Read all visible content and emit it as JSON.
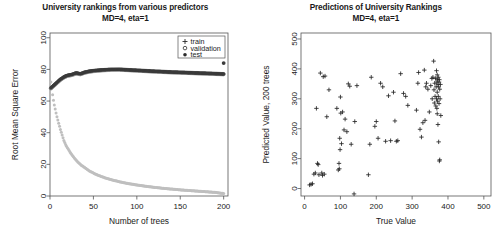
{
  "figure": {
    "background": "#ffffff",
    "panels": 2
  },
  "chart_data": [
    {
      "type": "line",
      "title": "University rankings from various predictors",
      "subtitle": "MD=4, eta=1",
      "xlabel": "Number of trees",
      "ylabel": "Root Mean Square Error",
      "xlim": [
        0,
        205
      ],
      "ylim": [
        0,
        103
      ],
      "xticks": [
        0,
        50,
        100,
        150,
        200
      ],
      "yticks": [
        0,
        20,
        40,
        60,
        80,
        100
      ],
      "grid": false,
      "legend_position": "top-right",
      "legend": [
        {
          "label": "train",
          "marker": "plus",
          "color": "#bcbcbc"
        },
        {
          "label": "validation",
          "marker": "circle-open",
          "color": "#8a8a8a"
        },
        {
          "label": "test",
          "marker": "circle-filled",
          "color": "#3a3a3a"
        }
      ],
      "series": [
        {
          "name": "train",
          "marker": "plus",
          "color": "#bfbfbf",
          "x": [
            1,
            2,
            3,
            4,
            5,
            6,
            7,
            8,
            9,
            10,
            12,
            14,
            16,
            18,
            20,
            24,
            28,
            32,
            36,
            40,
            45,
            50,
            55,
            60,
            65,
            70,
            80,
            90,
            100,
            110,
            120,
            130,
            140,
            150,
            160,
            170,
            180,
            190,
            200
          ],
          "values": [
            72.0,
            68.5,
            64.0,
            60.5,
            57.5,
            55.0,
            52.5,
            50.0,
            48.0,
            46.0,
            42.0,
            38.5,
            35.0,
            32.5,
            30.5,
            27.0,
            24.0,
            21.5,
            19.5,
            18.0,
            16.0,
            14.5,
            13.2,
            12.2,
            11.2,
            10.4,
            9.0,
            7.9,
            7.0,
            6.2,
            5.5,
            4.9,
            4.4,
            3.9,
            3.5,
            3.1,
            2.7,
            2.3,
            1.6
          ]
        },
        {
          "name": "validation",
          "marker": "circle-open",
          "color": "#8a8a8a",
          "x": [
            1,
            2,
            3,
            4,
            5,
            6,
            7,
            8,
            9,
            10,
            12,
            14,
            16,
            18,
            20,
            25,
            30,
            35,
            40,
            45,
            50,
            60,
            70,
            80,
            90,
            100,
            120,
            140,
            160,
            180,
            200
          ],
          "values": [
            68.0,
            68.5,
            69.0,
            69.5,
            70.0,
            70.5,
            71.0,
            71.5,
            72.0,
            72.5,
            73.5,
            74.2,
            75.0,
            75.5,
            76.0,
            76.5,
            77.5,
            77.0,
            78.0,
            78.6,
            79.0,
            79.5,
            79.8,
            79.9,
            79.6,
            79.3,
            78.7,
            78.2,
            77.8,
            77.4,
            77.0
          ]
        },
        {
          "name": "test",
          "marker": "circle-filled",
          "color": "#3a3a3a",
          "x": [
            1,
            2,
            3,
            4,
            5,
            6,
            7,
            8,
            9,
            10,
            12,
            14,
            16,
            18,
            20,
            25,
            30,
            35,
            40,
            45,
            50,
            60,
            70,
            80,
            90,
            100,
            120,
            140,
            160,
            180,
            200
          ],
          "values": [
            68.2,
            68.8,
            69.3,
            69.8,
            70.3,
            70.8,
            71.3,
            71.8,
            72.3,
            72.8,
            73.8,
            74.5,
            75.2,
            75.8,
            76.2,
            76.8,
            77.8,
            77.2,
            78.2,
            78.8,
            79.2,
            79.7,
            80.0,
            80.0,
            79.7,
            79.4,
            78.8,
            78.3,
            77.9,
            77.5,
            77.1
          ]
        }
      ]
    },
    {
      "type": "scatter",
      "title": "Predictions of University Rankings",
      "subtitle": "MD=4, eta=1",
      "xlabel": "True Value",
      "ylabel": "Predicted Value, 200 trees",
      "xlim": [
        -10,
        520
      ],
      "ylim": [
        -25,
        520
      ],
      "xticks": [
        0,
        100,
        200,
        300,
        400,
        500
      ],
      "yticks": [
        0,
        100,
        200,
        300,
        400,
        500
      ],
      "grid": false,
      "marker": "plus",
      "marker_color": "#262626",
      "points": [
        [
          14,
          12
        ],
        [
          18,
          14
        ],
        [
          22,
          16
        ],
        [
          26,
          48
        ],
        [
          30,
          52
        ],
        [
          33,
          268
        ],
        [
          36,
          84
        ],
        [
          38,
          80
        ],
        [
          40,
          46
        ],
        [
          44,
          386
        ],
        [
          48,
          52
        ],
        [
          50,
          44
        ],
        [
          52,
          374
        ],
        [
          55,
          48
        ],
        [
          57,
          376
        ],
        [
          62,
          240
        ],
        [
          68,
          330
        ],
        [
          90,
          268
        ],
        [
          94,
          62
        ],
        [
          96,
          84
        ],
        [
          97,
          66
        ],
        [
          98,
          168
        ],
        [
          99,
          130
        ],
        [
          100,
          306
        ],
        [
          101,
          252
        ],
        [
          103,
          150
        ],
        [
          106,
          256
        ],
        [
          110,
          196
        ],
        [
          113,
          232
        ],
        [
          118,
          190
        ],
        [
          122,
          350
        ],
        [
          126,
          342
        ],
        [
          130,
          148
        ],
        [
          138,
          -18
        ],
        [
          140,
          224
        ],
        [
          146,
          344
        ],
        [
          178,
          46
        ],
        [
          182,
          148
        ],
        [
          186,
          372
        ],
        [
          196,
          208
        ],
        [
          200,
          224
        ],
        [
          205,
          168
        ],
        [
          212,
          352
        ],
        [
          218,
          340
        ],
        [
          226,
          158
        ],
        [
          234,
          310
        ],
        [
          240,
          160
        ],
        [
          248,
          322
        ],
        [
          252,
          226
        ],
        [
          256,
          158
        ],
        [
          260,
          160
        ],
        [
          268,
          384
        ],
        [
          276,
          318
        ],
        [
          282,
          308
        ],
        [
          288,
          278
        ],
        [
          312,
          262
        ],
        [
          316,
          352
        ],
        [
          318,
          388
        ],
        [
          322,
          198
        ],
        [
          326,
          172
        ],
        [
          330,
          220
        ],
        [
          334,
          396
        ],
        [
          336,
          228
        ],
        [
          338,
          340
        ],
        [
          340,
          352
        ],
        [
          344,
          332
        ],
        [
          348,
          256
        ],
        [
          352,
          344
        ],
        [
          355,
          368
        ],
        [
          356,
          300
        ],
        [
          358,
          372
        ],
        [
          360,
          426
        ],
        [
          361,
          330
        ],
        [
          362,
          286
        ],
        [
          363,
          352
        ],
        [
          364,
          308
        ],
        [
          365,
          368
        ],
        [
          366,
          276
        ],
        [
          367,
          340
        ],
        [
          368,
          394
        ],
        [
          368,
          300
        ],
        [
          369,
          356
        ],
        [
          369,
          268
        ],
        [
          370,
          380
        ],
        [
          370,
          322
        ],
        [
          370,
          250
        ],
        [
          371,
          364
        ],
        [
          371,
          292
        ],
        [
          372,
          348
        ],
        [
          372,
          214
        ],
        [
          373,
          372
        ],
        [
          373,
          308
        ],
        [
          374,
          340
        ],
        [
          374,
          156
        ],
        [
          375,
          356
        ],
        [
          375,
          284
        ],
        [
          376,
          364
        ],
        [
          376,
          92
        ],
        [
          377,
          332
        ],
        [
          377,
          96
        ],
        [
          378,
          300
        ],
        [
          379,
          348
        ],
        [
          380,
          244
        ]
      ]
    }
  ]
}
